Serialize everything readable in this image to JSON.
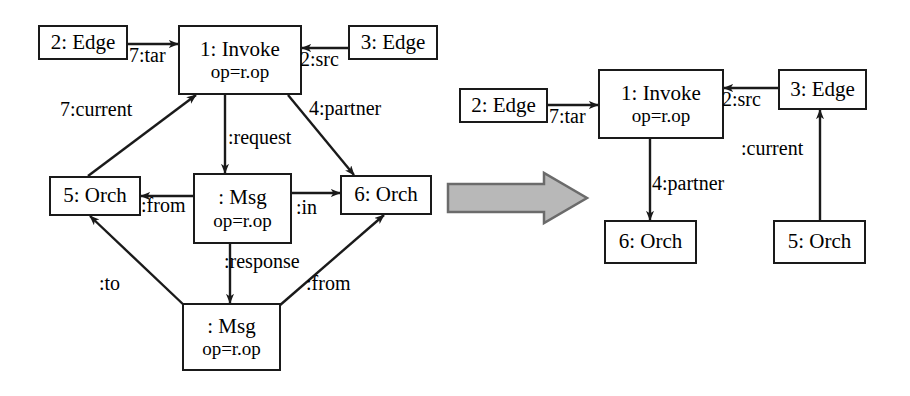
{
  "figure": {
    "kind": "graph-transformation-diagram",
    "colors": {
      "stroke": "#1a1a1a",
      "node_fill": "#ffffff",
      "big_arrow_fill": "#b8b8b8",
      "big_arrow_stroke": "#6b6b6b",
      "background": "#ffffff"
    }
  },
  "left_graph": {
    "nodes": {
      "edge2": {
        "title": "2: Edge",
        "sub": ""
      },
      "invoke1": {
        "title": "1: Invoke",
        "sub": "op=r.op"
      },
      "edge3": {
        "title": "3: Edge",
        "sub": ""
      },
      "orch5": {
        "title": "5: Orch",
        "sub": ""
      },
      "msg_req": {
        "title": ": Msg",
        "sub": "op=r.op"
      },
      "orch6": {
        "title": "6: Orch",
        "sub": ""
      },
      "msg_res": {
        "title": ": Msg",
        "sub": "op=r.op"
      }
    },
    "edge_labels": {
      "tar": "7:tar",
      "src": "2:src",
      "current": "7:current",
      "partner": "4:partner",
      "request": ":request",
      "from_msg": ":from",
      "in": ":in",
      "response": ":response",
      "to": ":to",
      "from_res": ":from"
    }
  },
  "right_graph": {
    "nodes": {
      "edge2": {
        "title": "2: Edge",
        "sub": ""
      },
      "invoke1": {
        "title": "1: Invoke",
        "sub": "op=r.op"
      },
      "edge3": {
        "title": "3: Edge",
        "sub": ""
      },
      "orch6": {
        "title": "6: Orch",
        "sub": ""
      },
      "orch5": {
        "title": "5: Orch",
        "sub": ""
      }
    },
    "edge_labels": {
      "tar": "7:tar",
      "src": "2:src",
      "partner": "4:partner",
      "current": ":current"
    }
  },
  "transform_arrow": {
    "name": "rewrite-arrow",
    "direction": "right"
  }
}
